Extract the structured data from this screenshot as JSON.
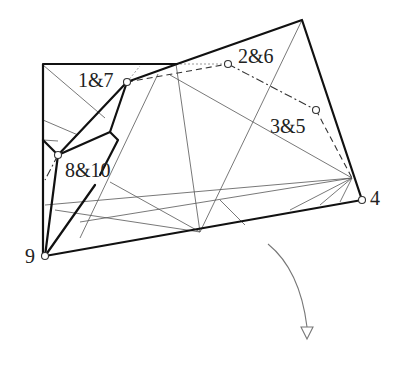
{
  "diagram": {
    "type": "folding / crease pattern diagram",
    "labels": {
      "node_1_7": "1&7",
      "node_2_6": "2&6",
      "node_3_5": "3&5",
      "node_8_10": "8&10",
      "node_4": "4",
      "node_9": "9"
    },
    "nodes": [
      {
        "id": "1&7",
        "x": 127,
        "y": 82
      },
      {
        "id": "2&6",
        "x": 228,
        "y": 64
      },
      {
        "id": "3&5",
        "x": 316,
        "y": 110
      },
      {
        "id": "4",
        "x": 362,
        "y": 200
      },
      {
        "id": "8&10",
        "x": 58,
        "y": 155
      },
      {
        "id": "9",
        "x": 45,
        "y": 256
      }
    ],
    "line_colors": {
      "thick": "#111111",
      "thin": "#555555",
      "dashed": "#333333",
      "arrow": "#777777"
    },
    "arrow": {
      "direction": "down",
      "description": "curved arrow indicating fold/rotation"
    }
  }
}
